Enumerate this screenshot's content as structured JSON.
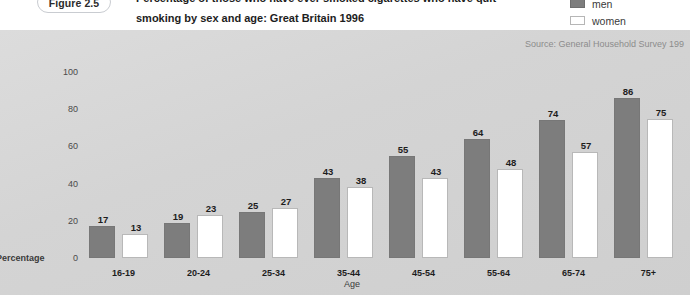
{
  "figure": {
    "badge": "Figure 2.5",
    "title_line1": "Percentage of those who have ever smoked cigarettes who have quit",
    "title_line2": "smoking by sex and age: Great Britain 1996"
  },
  "legend": {
    "items": [
      {
        "label": "men",
        "color": "#7d7d7d"
      },
      {
        "label": "women",
        "color": "#ffffff"
      }
    ]
  },
  "source": "Source: General Household Survey 199",
  "chart_data": {
    "type": "bar",
    "title": "Percentage of those who have ever smoked cigarettes who have quit smoking by sex and age: Great Britain 1996",
    "xlabel": "Age",
    "ylabel": "Percentage",
    "ylim": [
      0,
      100
    ],
    "yticks": [
      0,
      20,
      40,
      60,
      80,
      100
    ],
    "grid": false,
    "legend_position": "top-right",
    "categories": [
      "16-19",
      "20-24",
      "25-34",
      "35-44",
      "45-54",
      "55-64",
      "65-74",
      "75+"
    ],
    "series": [
      {
        "name": "men",
        "color": "#7d7d7d",
        "values": [
          17,
          19,
          25,
          43,
          55,
          64,
          74,
          86
        ]
      },
      {
        "name": "women",
        "color": "#ffffff",
        "values": [
          13,
          23,
          27,
          38,
          43,
          48,
          57,
          75
        ]
      }
    ]
  }
}
